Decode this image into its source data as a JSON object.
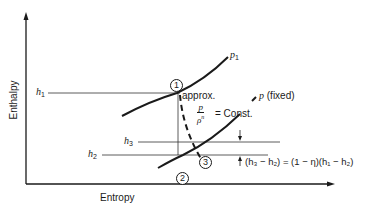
{
  "diagram": {
    "type": "enthalpy-entropy (h-s) diagram",
    "axes": {
      "x_label": "Entropy",
      "y_label": "Enthalpy"
    },
    "levels": {
      "h1": "h",
      "h1_sub": "1",
      "h2": "h",
      "h2_sub": "2",
      "h3": "h",
      "h3_sub": "3"
    },
    "curves": {
      "upper": {
        "label": "p",
        "sub": "1"
      },
      "lower": {
        "label": "p",
        "suffix": "(fixed)"
      }
    },
    "states": [
      "1",
      "2",
      "3"
    ],
    "annotation": {
      "approx": "approx.",
      "fraction_num": "p",
      "fraction_den": "ρ",
      "fraction_exp": "n",
      "const": "= Const."
    },
    "formula": "(h₃ − h₂) = (1 − η)(h₁ − h₂)"
  }
}
